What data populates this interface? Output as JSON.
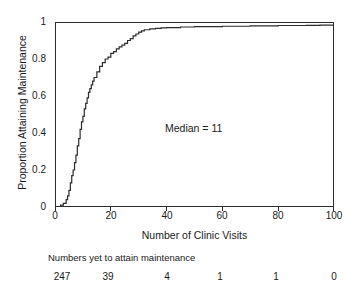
{
  "chart_data": {
    "type": "line",
    "title": "",
    "subtitle": "",
    "xlabel": "Number of Clinic Visits",
    "ylabel": "Proportion Attaining Maintenance",
    "xlim": [
      0,
      100
    ],
    "ylim": [
      0,
      1
    ],
    "grid": false,
    "legend": "none",
    "style": "step-function (cumulative incidence / Kaplan-Meier style)",
    "x_ticks": [
      0,
      20,
      40,
      60,
      80,
      100
    ],
    "x_tick_labels": [
      "0",
      "20",
      "40",
      "60",
      "80",
      "100"
    ],
    "y_ticks": [
      0,
      0.2,
      0.4,
      0.6,
      0.8,
      1
    ],
    "y_tick_labels": [
      "0",
      "0.2",
      "0.4",
      "0.6",
      "0.8",
      "1"
    ],
    "annotations": [
      {
        "text": "Median = 11",
        "x": 43,
        "y": 0.46
      }
    ],
    "series": [
      {
        "name": "Proportion attaining maintenance",
        "color": "#2b2b2b",
        "x": [
          0,
          1,
          2,
          3,
          4,
          4.5,
          5,
          5.5,
          6,
          6.5,
          7,
          7.5,
          8,
          8.5,
          9,
          9.5,
          10,
          10.5,
          11,
          11.5,
          12,
          12.5,
          13,
          13.5,
          14,
          15,
          16,
          17,
          18,
          19,
          20,
          21,
          22,
          23,
          24,
          25,
          26,
          27,
          28,
          29,
          30,
          31,
          32,
          34,
          36,
          38,
          40,
          45,
          50,
          60,
          70,
          80,
          90,
          95,
          100
        ],
        "y": [
          0.0,
          0.0,
          0.01,
          0.02,
          0.04,
          0.06,
          0.09,
          0.13,
          0.17,
          0.2,
          0.24,
          0.28,
          0.33,
          0.37,
          0.42,
          0.46,
          0.49,
          0.53,
          0.56,
          0.59,
          0.62,
          0.64,
          0.66,
          0.68,
          0.7,
          0.73,
          0.76,
          0.78,
          0.8,
          0.81,
          0.83,
          0.84,
          0.855,
          0.865,
          0.875,
          0.885,
          0.9,
          0.91,
          0.925,
          0.935,
          0.945,
          0.952,
          0.958,
          0.963,
          0.966,
          0.968,
          0.97,
          0.973,
          0.975,
          0.977,
          0.979,
          0.981,
          0.982,
          0.983,
          0.984
        ]
      }
    ],
    "risk_table": {
      "caption": "Numbers yet to attain maintenance",
      "at_x": [
        0,
        20,
        40,
        60,
        80,
        100
      ],
      "values": [
        "247",
        "39",
        "4",
        "1",
        "1",
        "0"
      ]
    }
  },
  "axes": {
    "y_title": "Proportion Attaining Maintenance",
    "x_title": "Number of Clinic Visits",
    "y_tick_labels": [
      "1",
      "0.8",
      "0.6",
      "0.4",
      "0.2",
      "0"
    ],
    "x_tick_labels": [
      "0",
      "20",
      "40",
      "60",
      "80",
      "100"
    ]
  },
  "annotation": {
    "median_text": "Median = 11"
  },
  "risk": {
    "caption": "Numbers yet to attain maintenance",
    "values": [
      "247",
      "39",
      "4",
      "1",
      "1",
      "0"
    ]
  },
  "colors": {
    "curve": "#2b2b2b",
    "frame": "#2b2b2b",
    "text": "#1a1a1a",
    "background": "#ffffff"
  }
}
